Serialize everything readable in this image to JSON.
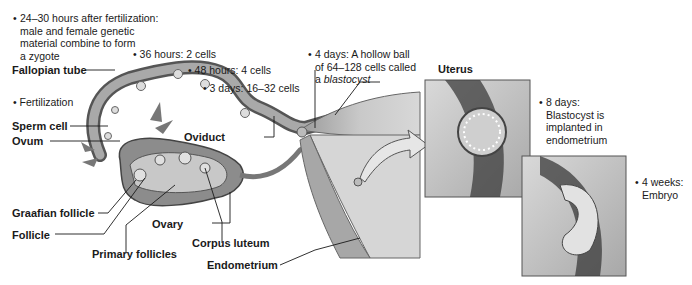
{
  "diagram": {
    "structure_labels": {
      "fallopian_tube": "Fallopian tube",
      "sperm_cell": "Sperm cell",
      "ovum": "Ovum",
      "oviduct": "Oviduct",
      "graafian_follicle": "Graafian follicle",
      "follicle": "Follicle",
      "ovary": "Ovary",
      "primary_follicles": "Primary follicles",
      "corpus_luteum": "Corpus luteum",
      "endometrium": "Endometrium",
      "uterus": "Uterus"
    },
    "stages": {
      "zygote": {
        "bullet": "•",
        "lines": [
          "24–30 hours after fertilization:",
          "male and female genetic",
          "material combine to form",
          "a zygote"
        ]
      },
      "fertilization": {
        "bullet": "•",
        "text": "Fertilization"
      },
      "two_cells": {
        "bullet": "•",
        "text": "36 hours: 2 cells"
      },
      "four_cells": {
        "bullet": "•",
        "text": "48 hours: 4 cells"
      },
      "morula": {
        "bullet": "•",
        "text": "3 days: 16–32 cells"
      },
      "blastocyst": {
        "bullet": "•",
        "line1": "4 days: A hollow ball",
        "line2": "of 64–128 cells called",
        "line3_prefix": "a ",
        "line3_term": "blastocyst"
      },
      "implantation": {
        "bullet": "•",
        "lines": [
          "8 days:",
          "Blastocyst is",
          "implanted in",
          "endometrium"
        ]
      },
      "embryo": {
        "bullet": "•",
        "lines": [
          "4 weeks:",
          "Embryo"
        ]
      }
    },
    "colors": {
      "tissue_light": "#bdbdbd",
      "tissue_mid": "#8a8a8a",
      "tissue_dark": "#3c3c3c",
      "leader_line": "#1a1a1a"
    }
  }
}
